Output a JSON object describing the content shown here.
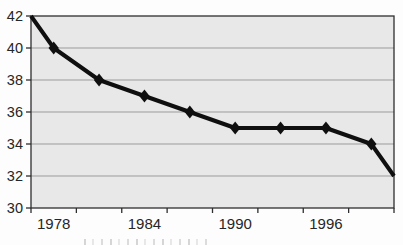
{
  "chart_data": {
    "type": "line",
    "title": "",
    "xlabel": "",
    "ylabel": "",
    "legend": "none",
    "grid": "horizontal",
    "marker": "diamond",
    "categories": [
      "1978",
      "1981",
      "1984",
      "1987",
      "1990",
      "1993",
      "1996",
      "1999"
    ],
    "values": [
      40,
      38,
      37,
      36,
      35,
      35,
      35,
      34
    ],
    "edge_points": {
      "left": 42,
      "right": 32
    },
    "x_tick_labels_visible": [
      {
        "label": "1978",
        "category_index": 0
      },
      {
        "label": "1984",
        "category_index": 2
      },
      {
        "label": "1990",
        "category_index": 4
      },
      {
        "label": "1996",
        "category_index": 6
      }
    ],
    "y_tick_labels": [
      "42",
      "40",
      "38",
      "36",
      "34",
      "32",
      "30"
    ],
    "ylim": [
      30,
      42
    ],
    "y_tick_step": 2,
    "colors": {
      "line": "#0f0f0f",
      "plot_background": "#e8e8e8",
      "gridline": "#9b9b9b",
      "border": "#2e2e2e",
      "tick_text": "#262626",
      "page_background": "#ffffff"
    }
  }
}
